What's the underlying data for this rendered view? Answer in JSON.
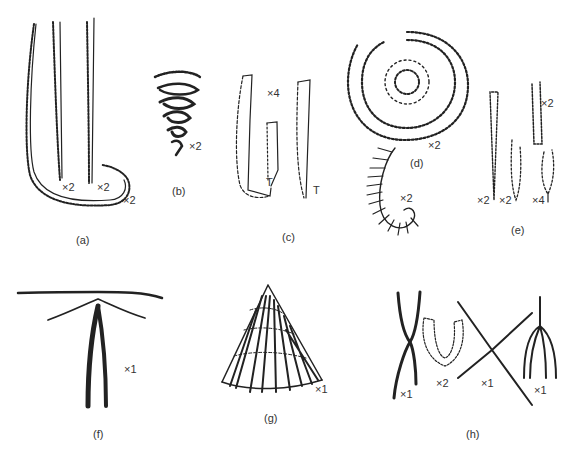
{
  "figure": {
    "panels": [
      {
        "id": "a",
        "caption": "(a)",
        "magnifications": [
          "×2",
          "×2",
          "×2"
        ]
      },
      {
        "id": "b",
        "caption": "(b)",
        "magnifications": [
          "×2"
        ]
      },
      {
        "id": "c",
        "caption": "(c)",
        "magnifications": [
          "×4"
        ],
        "markers": [
          "T",
          "T"
        ]
      },
      {
        "id": "d",
        "caption": "(d)",
        "magnifications": [
          "×2",
          "×2"
        ]
      },
      {
        "id": "e",
        "caption": "(e)",
        "magnifications": [
          "×2",
          "×2",
          "×2",
          "×4"
        ]
      },
      {
        "id": "f",
        "caption": "(f)",
        "magnifications": [
          "×1"
        ]
      },
      {
        "id": "g",
        "caption": "(g)",
        "magnifications": [
          "×1"
        ]
      },
      {
        "id": "h",
        "caption": "(h)",
        "magnifications": [
          "×1",
          "×2",
          "×1",
          "×1"
        ]
      }
    ]
  }
}
